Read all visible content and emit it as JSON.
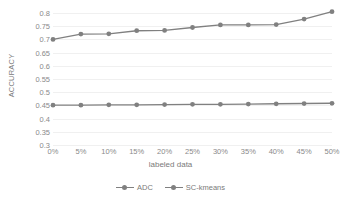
{
  "chart_data": {
    "type": "line",
    "title": "",
    "xlabel": "labeled data",
    "ylabel": "ACCURACY",
    "categories": [
      "0%",
      "5%",
      "10%",
      "15%",
      "20%",
      "25%",
      "30%",
      "35%",
      "40%",
      "45%",
      "50%"
    ],
    "x_values": [
      0,
      5,
      10,
      15,
      20,
      25,
      30,
      35,
      40,
      45,
      50
    ],
    "ylim": [
      0.3,
      0.8
    ],
    "ytick_labels": [
      "0.8",
      "0.75",
      "0.7",
      "0.65",
      "0.6",
      "0.55",
      "0.5",
      "0.45",
      "0.4",
      "0.35",
      "0.3"
    ],
    "ytick_values": [
      0.8,
      0.75,
      0.7,
      0.65,
      0.6,
      0.55,
      0.5,
      0.45,
      0.4,
      0.35,
      0.3
    ],
    "ystep": 0.05,
    "grid": true,
    "grid_axis": "y",
    "legend_position": "bottom",
    "series": [
      {
        "name": "ADC",
        "color": "#808080",
        "marker": "circle",
        "values": [
          0.7,
          0.72,
          0.721,
          0.733,
          0.734,
          0.745,
          0.755,
          0.755,
          0.756,
          0.777,
          0.805
        ]
      },
      {
        "name": "SC-kmeans",
        "color": "#808080",
        "marker": "circle",
        "values": [
          0.451,
          0.451,
          0.452,
          0.452,
          0.453,
          0.454,
          0.454,
          0.455,
          0.456,
          0.457,
          0.458
        ]
      }
    ]
  },
  "legend": {
    "items": [
      {
        "label": "ADC"
      },
      {
        "label": "SC-kmeans"
      }
    ]
  },
  "colors": {
    "series_line": "#808080",
    "gridline": "#f0f0f0",
    "tick_text": "#8a8a8a",
    "axis_title_text": "#7a7a7a",
    "background": "#ffffff"
  }
}
